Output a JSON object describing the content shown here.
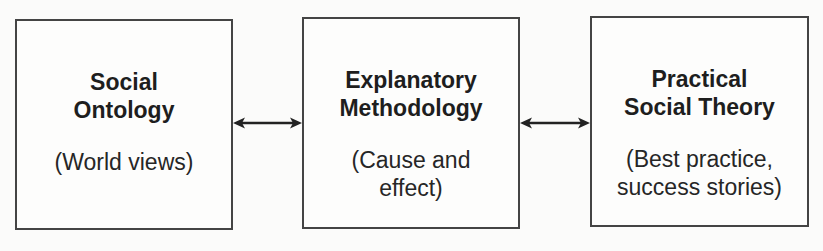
{
  "diagram": {
    "type": "flow",
    "colors": {
      "border": "#444444",
      "text": "#1e1e1e",
      "arrow": "#222222",
      "background": "#fbfbfa"
    },
    "boxes": [
      {
        "id": "social-ontology",
        "title": "Social\nOntology",
        "subtitle": "(World views)"
      },
      {
        "id": "explanatory-methodology",
        "title": "Explanatory\nMethodology",
        "subtitle": "(Cause and\neffect)"
      },
      {
        "id": "practical-social-theory",
        "title": "Practical\nSocial Theory",
        "subtitle": "(Best practice,\nsuccess stories)"
      }
    ],
    "connections": [
      {
        "from": "social-ontology",
        "to": "explanatory-methodology",
        "direction": "bidirectional"
      },
      {
        "from": "explanatory-methodology",
        "to": "practical-social-theory",
        "direction": "bidirectional"
      }
    ]
  }
}
